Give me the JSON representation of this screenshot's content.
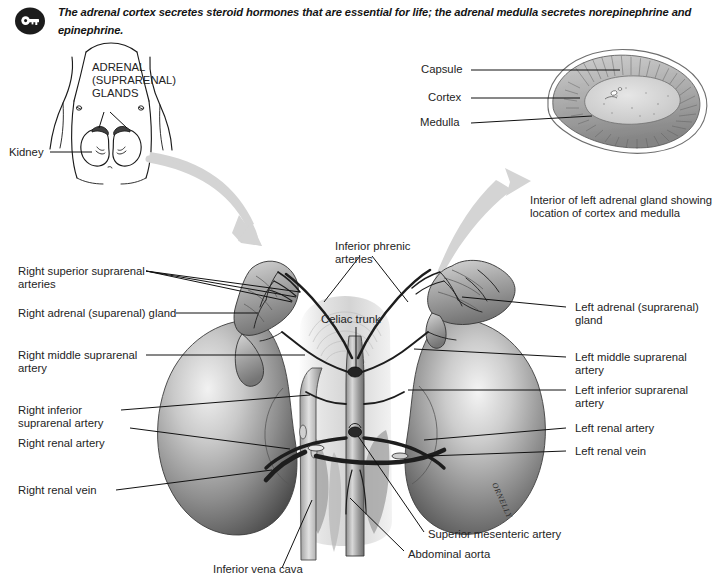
{
  "header": {
    "icon": "key-icon",
    "text": "The adrenal cortex secretes steroid hormones that are essential for life; the adrenal medulla secretes norepinephrine and epinephrine."
  },
  "torso_figure": {
    "title_lines": [
      "ADRENAL",
      "(SUPRARENAL)",
      "GLANDS"
    ],
    "kidney_label": "Kidney"
  },
  "inset_figure": {
    "labels": [
      "Capsule",
      "Cortex",
      "Medulla"
    ],
    "caption_lines": [
      "Interior of left adrenal gland showing",
      "location of cortex and medulla"
    ]
  },
  "main_figure": {
    "left_labels": [
      {
        "lines": [
          "Right superior suprarenal",
          "arteries"
        ]
      },
      {
        "lines": [
          "Right adrenal (suparenal) gland"
        ]
      },
      {
        "lines": [
          "Right middle suprarenal",
          "artery"
        ]
      },
      {
        "lines": [
          "Right inferior",
          "suprarenal artery"
        ]
      },
      {
        "lines": [
          "Right renal artery"
        ]
      },
      {
        "lines": [
          "Right renal vein"
        ]
      }
    ],
    "right_labels": [
      {
        "lines": [
          "Left adrenal (suprarenal)",
          "gland"
        ]
      },
      {
        "lines": [
          "Left middle suprarenal",
          "artery"
        ]
      },
      {
        "lines": [
          "Left inferior suprarenal",
          "artery"
        ]
      },
      {
        "lines": [
          "Left renal artery"
        ]
      },
      {
        "lines": [
          "Left renal vein"
        ]
      }
    ],
    "center_labels": [
      {
        "lines": [
          "Inferior phrenic",
          "arteries"
        ]
      },
      {
        "lines": [
          "Celiac trunk"
        ]
      }
    ],
    "bottom_labels": [
      {
        "lines": [
          "Superior mesenteric artery"
        ]
      },
      {
        "lines": [
          "Abdominal aorta"
        ]
      },
      {
        "lines": [
          "Inferior vena cava"
        ]
      }
    ],
    "artist_signature": "ORNELLY"
  },
  "colors": {
    "ink": "#1a1a1a",
    "arrow_gray": "#d2d2d2",
    "organ_gray": "#9a9a9a",
    "gland_gray": "#b4b4b4",
    "page_bg": "#ffffff"
  }
}
